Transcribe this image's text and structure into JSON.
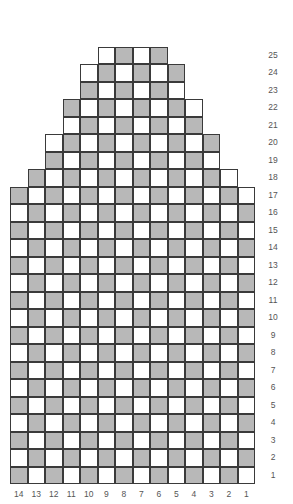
{
  "chart_data": {
    "type": "heatmap",
    "title": "",
    "subtitle": "",
    "xlabel": "",
    "ylabel": "",
    "legend": [],
    "grid": true,
    "columns": 14,
    "rows": 25,
    "x_tick_labels": [
      "14",
      "13",
      "12",
      "11",
      "10",
      "9",
      "8",
      "7",
      "6",
      "5",
      "4",
      "3",
      "2",
      "1"
    ],
    "y_tick_labels": [
      "25",
      "24",
      "23",
      "22",
      "21",
      "20",
      "19",
      "18",
      "17",
      "16",
      "15",
      "14",
      "13",
      "12",
      "11",
      "10",
      "9",
      "8",
      "7",
      "6",
      "5",
      "4",
      "3",
      "2",
      "1"
    ],
    "x_axis_direction": "right-to-left",
    "y_axis_direction": "bottom-to-top",
    "cell_states": [
      "empty",
      "marked"
    ],
    "colors": {
      "empty": "#ffffff",
      "marked": "#b8b8b8",
      "cell_border": "#3a3a3a",
      "tick_label": "#555555",
      "background": "#ffffff"
    },
    "rows_data": [
      {
        "row": 25,
        "start_col": 9,
        "end_col": 6,
        "cells": [
          "empty",
          "marked",
          "empty",
          "marked"
        ]
      },
      {
        "row": 24,
        "start_col": 10,
        "end_col": 5,
        "cells": [
          "empty",
          "marked",
          "empty",
          "marked",
          "empty",
          "marked"
        ]
      },
      {
        "row": 23,
        "start_col": 10,
        "end_col": 5,
        "cells": [
          "marked",
          "empty",
          "marked",
          "empty",
          "marked",
          "empty"
        ]
      },
      {
        "row": 22,
        "start_col": 11,
        "end_col": 4,
        "cells": [
          "marked",
          "empty",
          "marked",
          "empty",
          "marked",
          "empty",
          "marked",
          "empty"
        ]
      },
      {
        "row": 21,
        "start_col": 11,
        "end_col": 4,
        "cells": [
          "empty",
          "marked",
          "empty",
          "marked",
          "empty",
          "marked",
          "empty",
          "marked"
        ]
      },
      {
        "row": 20,
        "start_col": 12,
        "end_col": 3,
        "cells": [
          "empty",
          "marked",
          "empty",
          "marked",
          "empty",
          "marked",
          "empty",
          "marked",
          "empty",
          "marked"
        ]
      },
      {
        "row": 19,
        "start_col": 12,
        "end_col": 3,
        "cells": [
          "marked",
          "empty",
          "marked",
          "empty",
          "marked",
          "empty",
          "marked",
          "empty",
          "marked",
          "empty"
        ]
      },
      {
        "row": 18,
        "start_col": 13,
        "end_col": 2,
        "cells": [
          "marked",
          "empty",
          "marked",
          "empty",
          "marked",
          "empty",
          "marked",
          "empty",
          "marked",
          "empty",
          "marked",
          "empty"
        ]
      },
      {
        "row": 17,
        "start_col": 14,
        "end_col": 1,
        "cells": [
          "marked",
          "empty",
          "marked",
          "empty",
          "marked",
          "empty",
          "marked",
          "empty",
          "marked",
          "empty",
          "marked",
          "empty",
          "marked",
          "empty"
        ]
      },
      {
        "row": 16,
        "start_col": 14,
        "end_col": 1,
        "cells": [
          "empty",
          "marked",
          "empty",
          "marked",
          "empty",
          "marked",
          "empty",
          "marked",
          "empty",
          "marked",
          "empty",
          "marked",
          "empty",
          "marked"
        ]
      },
      {
        "row": 15,
        "start_col": 14,
        "end_col": 1,
        "cells": [
          "marked",
          "empty",
          "marked",
          "empty",
          "marked",
          "empty",
          "marked",
          "empty",
          "marked",
          "empty",
          "marked",
          "empty",
          "marked",
          "empty"
        ]
      },
      {
        "row": 14,
        "start_col": 14,
        "end_col": 1,
        "cells": [
          "empty",
          "marked",
          "empty",
          "marked",
          "empty",
          "marked",
          "empty",
          "marked",
          "empty",
          "marked",
          "empty",
          "marked",
          "empty",
          "marked"
        ]
      },
      {
        "row": 13,
        "start_col": 14,
        "end_col": 1,
        "cells": [
          "marked",
          "empty",
          "marked",
          "empty",
          "marked",
          "empty",
          "marked",
          "empty",
          "marked",
          "empty",
          "marked",
          "empty",
          "marked",
          "empty"
        ]
      },
      {
        "row": 12,
        "start_col": 14,
        "end_col": 1,
        "cells": [
          "empty",
          "marked",
          "empty",
          "marked",
          "empty",
          "marked",
          "empty",
          "marked",
          "empty",
          "marked",
          "empty",
          "marked",
          "empty",
          "marked"
        ]
      },
      {
        "row": 11,
        "start_col": 14,
        "end_col": 1,
        "cells": [
          "marked",
          "empty",
          "marked",
          "empty",
          "marked",
          "empty",
          "marked",
          "empty",
          "marked",
          "empty",
          "marked",
          "empty",
          "marked",
          "empty"
        ]
      },
      {
        "row": 10,
        "start_col": 14,
        "end_col": 1,
        "cells": [
          "empty",
          "marked",
          "empty",
          "marked",
          "empty",
          "marked",
          "empty",
          "marked",
          "empty",
          "marked",
          "empty",
          "marked",
          "empty",
          "marked"
        ]
      },
      {
        "row": 9,
        "start_col": 14,
        "end_col": 1,
        "cells": [
          "marked",
          "empty",
          "marked",
          "empty",
          "marked",
          "empty",
          "marked",
          "empty",
          "marked",
          "empty",
          "marked",
          "empty",
          "marked",
          "empty"
        ]
      },
      {
        "row": 8,
        "start_col": 14,
        "end_col": 1,
        "cells": [
          "empty",
          "marked",
          "empty",
          "marked",
          "empty",
          "marked",
          "empty",
          "marked",
          "empty",
          "marked",
          "empty",
          "marked",
          "empty",
          "marked"
        ]
      },
      {
        "row": 7,
        "start_col": 14,
        "end_col": 1,
        "cells": [
          "marked",
          "empty",
          "marked",
          "empty",
          "marked",
          "empty",
          "marked",
          "empty",
          "marked",
          "empty",
          "marked",
          "empty",
          "marked",
          "empty"
        ]
      },
      {
        "row": 6,
        "start_col": 14,
        "end_col": 1,
        "cells": [
          "empty",
          "marked",
          "empty",
          "marked",
          "empty",
          "marked",
          "empty",
          "marked",
          "empty",
          "marked",
          "empty",
          "marked",
          "empty",
          "marked"
        ]
      },
      {
        "row": 5,
        "start_col": 14,
        "end_col": 1,
        "cells": [
          "marked",
          "empty",
          "marked",
          "empty",
          "marked",
          "empty",
          "marked",
          "empty",
          "marked",
          "empty",
          "marked",
          "empty",
          "marked",
          "empty"
        ]
      },
      {
        "row": 4,
        "start_col": 14,
        "end_col": 1,
        "cells": [
          "empty",
          "marked",
          "empty",
          "marked",
          "empty",
          "marked",
          "empty",
          "marked",
          "empty",
          "marked",
          "empty",
          "marked",
          "empty",
          "marked"
        ]
      },
      {
        "row": 3,
        "start_col": 14,
        "end_col": 1,
        "cells": [
          "marked",
          "empty",
          "marked",
          "empty",
          "marked",
          "empty",
          "marked",
          "empty",
          "marked",
          "empty",
          "marked",
          "empty",
          "marked",
          "empty"
        ]
      },
      {
        "row": 2,
        "start_col": 14,
        "end_col": 1,
        "cells": [
          "empty",
          "marked",
          "empty",
          "marked",
          "empty",
          "marked",
          "empty",
          "marked",
          "empty",
          "marked",
          "empty",
          "marked",
          "empty",
          "marked"
        ]
      },
      {
        "row": 1,
        "start_col": 14,
        "end_col": 1,
        "cells": [
          "marked",
          "empty",
          "marked",
          "empty",
          "marked",
          "empty",
          "marked",
          "empty",
          "marked",
          "empty",
          "marked",
          "empty",
          "marked",
          "empty"
        ]
      }
    ]
  },
  "layout": {
    "grid_left": 10,
    "grid_bottom": 484,
    "cell_width": 17.5,
    "cell_height": 17.5,
    "row_label_x": 262,
    "col_label_y": 490
  }
}
